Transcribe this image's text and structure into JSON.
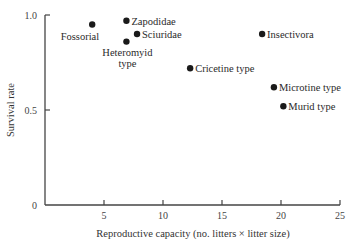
{
  "chart_data": {
    "type": "scatter",
    "title": "",
    "xlabel": "Reproductive capacity (no. litters × litter size)",
    "ylabel": "Survival rate",
    "xlim": [
      0,
      25
    ],
    "ylim": [
      0,
      1.0
    ],
    "xticks": [
      5,
      10,
      15,
      20,
      25
    ],
    "yticks": [
      0,
      0.5,
      1.0
    ],
    "xtick_labels": [
      "5",
      "10",
      "15",
      "20",
      "25"
    ],
    "ytick_labels": [
      "0",
      "0.5",
      "1.0"
    ],
    "grid": false,
    "legend": "none",
    "points": [
      {
        "label": "Fossorial",
        "x": 4.0,
        "y": 0.95,
        "label_pos": "below-left"
      },
      {
        "label": "Zapodidae",
        "x": 6.9,
        "y": 0.97,
        "label_pos": "right"
      },
      {
        "label": "Sciuridae",
        "x": 7.8,
        "y": 0.9,
        "label_pos": "right"
      },
      {
        "label": "Heteromyid type",
        "x": 6.9,
        "y": 0.86,
        "label_pos": "below"
      },
      {
        "label": "Insectivora",
        "x": 18.4,
        "y": 0.9,
        "label_pos": "right"
      },
      {
        "label": "Cricetine type",
        "x": 12.3,
        "y": 0.72,
        "label_pos": "right"
      },
      {
        "label": "Microtine type",
        "x": 19.4,
        "y": 0.62,
        "label_pos": "right"
      },
      {
        "label": "Murid type",
        "x": 20.2,
        "y": 0.52,
        "label_pos": "right"
      }
    ]
  }
}
